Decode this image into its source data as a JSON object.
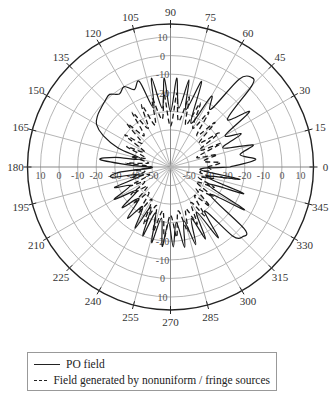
{
  "chart_data": {
    "type": "polar-line",
    "title": "",
    "angular_axis": {
      "unit": "degrees",
      "direction": "counterclockwise",
      "zero_position": "east",
      "tick_labels": [
        "0",
        "15",
        "30",
        "45",
        "60",
        "75",
        "90",
        "105",
        "120",
        "135",
        "150",
        "165",
        "180",
        "195",
        "210",
        "225",
        "240",
        "255",
        "270",
        "285",
        "300",
        "315",
        "330",
        "345"
      ]
    },
    "radial_axis": {
      "unit": "dB",
      "range": [
        -60,
        17
      ],
      "ticks": [
        -50,
        -40,
        -30,
        -20,
        -10,
        0,
        10
      ],
      "tick_labels": [
        "-50",
        "-40",
        "-30",
        "-20",
        "-10",
        "0",
        "10"
      ],
      "grid": true
    },
    "series": [
      {
        "name": "PO field",
        "style": "solid",
        "description": "Multi-lobe pattern; main lobe near 45-50 deg reaching ~+5 dB, broad shoulder 90-155 deg around -10 dB with dense ripple, side lobes near 0-30 deg and 180-190 deg, dense ripple lobes 240-320 deg up to about -15 dB with a larger lobe near 320 deg",
        "points": [
          [
            0,
            -28
          ],
          [
            5,
            -14
          ],
          [
            10,
            -22
          ],
          [
            15,
            -14
          ],
          [
            20,
            -30
          ],
          [
            25,
            -18
          ],
          [
            30,
            -26
          ],
          [
            35,
            -8
          ],
          [
            40,
            -20
          ],
          [
            45,
            2
          ],
          [
            48,
            5
          ],
          [
            52,
            0
          ],
          [
            55,
            -22
          ],
          [
            60,
            -16
          ],
          [
            65,
            -34
          ],
          [
            70,
            -11
          ],
          [
            75,
            -28
          ],
          [
            78,
            -12
          ],
          [
            82,
            -28
          ],
          [
            86,
            -12
          ],
          [
            90,
            -30
          ],
          [
            94,
            -12
          ],
          [
            98,
            -28
          ],
          [
            102,
            -11
          ],
          [
            106,
            -27
          ],
          [
            110,
            -11
          ],
          [
            115,
            -14
          ],
          [
            120,
            -10
          ],
          [
            125,
            -12
          ],
          [
            130,
            -9
          ],
          [
            135,
            -10
          ],
          [
            140,
            -11
          ],
          [
            145,
            -12
          ],
          [
            150,
            -14
          ],
          [
            155,
            -20
          ],
          [
            160,
            -30
          ],
          [
            165,
            -44
          ],
          [
            170,
            -30
          ],
          [
            174,
            -22
          ],
          [
            178,
            -40
          ],
          [
            182,
            -50
          ],
          [
            186,
            -32
          ],
          [
            190,
            -28
          ],
          [
            195,
            -45
          ],
          [
            200,
            -28
          ],
          [
            205,
            -36
          ],
          [
            210,
            -25
          ],
          [
            215,
            -38
          ],
          [
            220,
            -26
          ],
          [
            225,
            -36
          ],
          [
            230,
            -24
          ],
          [
            235,
            -34
          ],
          [
            240,
            -22
          ],
          [
            244,
            -36
          ],
          [
            248,
            -20
          ],
          [
            252,
            -34
          ],
          [
            256,
            -18
          ],
          [
            260,
            -32
          ],
          [
            264,
            -17
          ],
          [
            268,
            -30
          ],
          [
            272,
            -17
          ],
          [
            276,
            -30
          ],
          [
            280,
            -16
          ],
          [
            284,
            -30
          ],
          [
            288,
            -16
          ],
          [
            292,
            -30
          ],
          [
            296,
            -17
          ],
          [
            300,
            -32
          ],
          [
            304,
            -14
          ],
          [
            308,
            -30
          ],
          [
            312,
            -10
          ],
          [
            316,
            -6
          ],
          [
            320,
            -8
          ],
          [
            325,
            -34
          ],
          [
            330,
            -14
          ],
          [
            335,
            -38
          ],
          [
            340,
            -18
          ],
          [
            345,
            -40
          ],
          [
            350,
            -22
          ],
          [
            355,
            -44
          ],
          [
            360,
            -28
          ]
        ]
      },
      {
        "name": "Field generated by nonuniform / fringe sources",
        "style": "dashed",
        "description": "Dense ripple pattern mostly inside -20 dB; peaks around -20 to -25 dB in 60-140 deg and 250-300 deg; small features near 0-20 deg around -35 dB",
        "points": [
          [
            0,
            -40
          ],
          [
            5,
            -33
          ],
          [
            10,
            -42
          ],
          [
            15,
            -34
          ],
          [
            20,
            -45
          ],
          [
            25,
            -30
          ],
          [
            30,
            -42
          ],
          [
            35,
            -28
          ],
          [
            40,
            -40
          ],
          [
            45,
            -26
          ],
          [
            50,
            -38
          ],
          [
            55,
            -24
          ],
          [
            60,
            -36
          ],
          [
            65,
            -22
          ],
          [
            70,
            -36
          ],
          [
            75,
            -21
          ],
          [
            80,
            -35
          ],
          [
            85,
            -20
          ],
          [
            90,
            -38
          ],
          [
            95,
            -21
          ],
          [
            100,
            -34
          ],
          [
            105,
            -22
          ],
          [
            110,
            -36
          ],
          [
            115,
            -23
          ],
          [
            120,
            -36
          ],
          [
            125,
            -24
          ],
          [
            130,
            -38
          ],
          [
            135,
            -27
          ],
          [
            140,
            -40
          ],
          [
            145,
            -30
          ],
          [
            150,
            -44
          ],
          [
            155,
            -34
          ],
          [
            160,
            -46
          ],
          [
            165,
            -38
          ],
          [
            170,
            -48
          ],
          [
            175,
            -36
          ],
          [
            180,
            -50
          ],
          [
            185,
            -40
          ],
          [
            190,
            -46
          ],
          [
            195,
            -38
          ],
          [
            200,
            -48
          ],
          [
            205,
            -36
          ],
          [
            210,
            -44
          ],
          [
            215,
            -34
          ],
          [
            220,
            -44
          ],
          [
            225,
            -32
          ],
          [
            230,
            -42
          ],
          [
            235,
            -30
          ],
          [
            240,
            -40
          ],
          [
            245,
            -26
          ],
          [
            250,
            -38
          ],
          [
            255,
            -24
          ],
          [
            260,
            -36
          ],
          [
            265,
            -22
          ],
          [
            270,
            -34
          ],
          [
            275,
            -22
          ],
          [
            280,
            -36
          ],
          [
            285,
            -24
          ],
          [
            290,
            -36
          ],
          [
            295,
            -26
          ],
          [
            300,
            -38
          ],
          [
            305,
            -28
          ],
          [
            310,
            -40
          ],
          [
            315,
            -30
          ],
          [
            320,
            -42
          ],
          [
            325,
            -32
          ],
          [
            330,
            -44
          ],
          [
            335,
            -34
          ],
          [
            340,
            -44
          ],
          [
            345,
            -36
          ],
          [
            350,
            -44
          ],
          [
            355,
            -38
          ],
          [
            360,
            -40
          ]
        ]
      }
    ],
    "legend": {
      "position": "bottom",
      "entries": [
        {
          "label": "PO  field",
          "style": "solid"
        },
        {
          "label": "Field generated by nonuniform / fringe sources",
          "style": "dashed"
        }
      ]
    }
  },
  "legend": {
    "po_label": "PO  field",
    "fringe_label": "Field generated by nonuniform / fringe sources"
  }
}
